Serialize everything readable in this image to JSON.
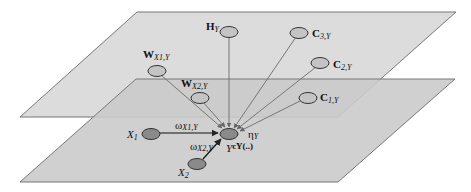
{
  "diagram": {
    "type": "two-layer graphical model",
    "planes": [
      {
        "name": "upper-plane",
        "fill": "#d9d9d9"
      },
      {
        "name": "lower-plane",
        "fill": "#c8c8c8"
      }
    ],
    "nodes": [
      {
        "id": "H_Y",
        "label": "H",
        "sub": "Y",
        "fill": "#c9c9c9"
      },
      {
        "id": "C3",
        "label": "C",
        "sub": "3,Y",
        "fill": "#c9c9c9"
      },
      {
        "id": "C2",
        "label": "C",
        "sub": "2,Y",
        "fill": "#c9c9c9"
      },
      {
        "id": "C1",
        "label": "C",
        "sub": "1,Y",
        "fill": "#c9c9c9"
      },
      {
        "id": "W_X1",
        "label": "W",
        "sub": "X1,Y",
        "fill": "#c9c9c9"
      },
      {
        "id": "W_X2",
        "label": "W",
        "sub": "X2,Y",
        "fill": "#c9c9c9"
      },
      {
        "id": "X1",
        "label": "X",
        "sub": "1",
        "fill": "#8c8c8c"
      },
      {
        "id": "X2",
        "label": "X",
        "sub": "2",
        "fill": "#8c8c8c"
      },
      {
        "id": "Y",
        "label": "Y",
        "sup": "cY(..)",
        "fill": "#8c8c8c"
      }
    ],
    "edge_labels": {
      "w_x1": "ω",
      "w_x1_sub": "X1,Y",
      "w_x2": "ω",
      "w_x2_sub": "X2,Y",
      "eta": "η",
      "eta_sub": "Y"
    },
    "labels": {
      "H": "H",
      "H_sub": "Y",
      "C3": "C",
      "C3_sub": "3,Y",
      "C2": "C",
      "C2_sub": "2,Y",
      "C1": "C",
      "C1_sub": "1,Y",
      "WX1": "W",
      "WX1_sub": "X1,Y",
      "WX2": "W",
      "WX2_sub": "X2,Y",
      "X1": "X",
      "X1_sub": "1",
      "X2": "X",
      "X2_sub": "2",
      "Y": "Y",
      "Y_sup": "cY(..)"
    }
  }
}
